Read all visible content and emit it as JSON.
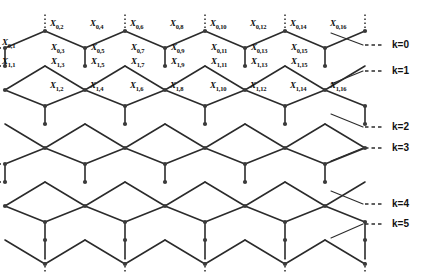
{
  "figure": {
    "type": "hexagonal-lattice-diagram",
    "width": 429,
    "height": 279,
    "background_color": "#ffffff",
    "line_color": "#2b2b2b",
    "node_color": "#3a3a3a",
    "label_color": "#111111"
  },
  "vertex_labels": [
    {
      "id": "x-0-1",
      "text": "X",
      "sub": "0,1",
      "x": 2,
      "y": 38
    },
    {
      "id": "x-1-1",
      "text": "X",
      "sub": "1,1",
      "x": 2,
      "y": 57
    },
    {
      "id": "x-0-2",
      "text": "X",
      "sub": "0,2",
      "x": 50,
      "y": 19
    },
    {
      "id": "x-0-4",
      "text": "X",
      "sub": "0,4",
      "x": 90,
      "y": 19
    },
    {
      "id": "x-0-6",
      "text": "X",
      "sub": "0,6",
      "x": 130,
      "y": 19
    },
    {
      "id": "x-0-8",
      "text": "X",
      "sub": "0,8",
      "x": 170,
      "y": 19
    },
    {
      "id": "x-0-10",
      "text": "X",
      "sub": "0,10",
      "x": 210,
      "y": 19
    },
    {
      "id": "x-0-12",
      "text": "X",
      "sub": "0,12",
      "x": 250,
      "y": 19
    },
    {
      "id": "x-0-14",
      "text": "X",
      "sub": "0,14",
      "x": 290,
      "y": 19
    },
    {
      "id": "x-0-16",
      "text": "X",
      "sub": "0,16",
      "x": 330,
      "y": 19
    },
    {
      "id": "x-0-3",
      "text": "X",
      "sub": "0,3",
      "x": 51,
      "y": 43
    },
    {
      "id": "x-0-5",
      "text": "X",
      "sub": "0,5",
      "x": 91,
      "y": 43
    },
    {
      "id": "x-0-7",
      "text": "X",
      "sub": "0,7",
      "x": 131,
      "y": 43
    },
    {
      "id": "x-0-9",
      "text": "X",
      "sub": "0,9",
      "x": 171,
      "y": 43
    },
    {
      "id": "x-0-11",
      "text": "X",
      "sub": "0,11",
      "x": 211,
      "y": 43
    },
    {
      "id": "x-0-13",
      "text": "X",
      "sub": "0,13",
      "x": 251,
      "y": 43
    },
    {
      "id": "x-0-15",
      "text": "X",
      "sub": "0,15",
      "x": 291,
      "y": 43
    },
    {
      "id": "x-1-3",
      "text": "X",
      "sub": "1,3",
      "x": 51,
      "y": 57
    },
    {
      "id": "x-1-5",
      "text": "X",
      "sub": "1,5",
      "x": 91,
      "y": 57
    },
    {
      "id": "x-1-7",
      "text": "X",
      "sub": "1,7",
      "x": 131,
      "y": 57
    },
    {
      "id": "x-1-9",
      "text": "X",
      "sub": "1,9",
      "x": 171,
      "y": 57
    },
    {
      "id": "x-1-11",
      "text": "X",
      "sub": "1,11",
      "x": 211,
      "y": 57
    },
    {
      "id": "x-1-13",
      "text": "X",
      "sub": "1,13",
      "x": 251,
      "y": 57
    },
    {
      "id": "x-1-15",
      "text": "X",
      "sub": "1,15",
      "x": 291,
      "y": 57
    },
    {
      "id": "x-1-2",
      "text": "X",
      "sub": "1,2",
      "x": 50,
      "y": 81
    },
    {
      "id": "x-1-4",
      "text": "X",
      "sub": "1,4",
      "x": 90,
      "y": 81
    },
    {
      "id": "x-1-6",
      "text": "X",
      "sub": "1,6",
      "x": 130,
      "y": 81
    },
    {
      "id": "x-1-8",
      "text": "X",
      "sub": "1,8",
      "x": 170,
      "y": 81
    },
    {
      "id": "x-1-10",
      "text": "X",
      "sub": "1,10",
      "x": 210,
      "y": 81
    },
    {
      "id": "x-1-12",
      "text": "X",
      "sub": "1,12",
      "x": 250,
      "y": 81
    },
    {
      "id": "x-1-14",
      "text": "X",
      "sub": "1,14",
      "x": 290,
      "y": 81
    },
    {
      "id": "x-1-16",
      "text": "X",
      "sub": "1,16",
      "x": 330,
      "y": 81
    }
  ],
  "k_labels": [
    {
      "id": "k-0",
      "text": "k=0",
      "x": 392,
      "y": 40
    },
    {
      "id": "k-1",
      "text": "k=1",
      "x": 392,
      "y": 66
    },
    {
      "id": "k-2",
      "text": "k=2",
      "x": 392,
      "y": 122
    },
    {
      "id": "k-3",
      "text": "k=3",
      "x": 392,
      "y": 143
    },
    {
      "id": "k-4",
      "text": "k=4",
      "x": 392,
      "y": 199
    },
    {
      "id": "k-5",
      "text": "k=5",
      "x": 392,
      "y": 219
    }
  ],
  "geometry": {
    "columns_x": [
      5,
      45,
      85,
      125,
      165,
      205,
      245,
      285,
      325,
      365
    ],
    "apex_rows_y": [
      31,
      90,
      148,
      206,
      264
    ],
    "waist_rows_y": [
      [
        48,
        66
      ],
      [
        106,
        124
      ],
      [
        164,
        182
      ],
      [
        222,
        240
      ]
    ],
    "node_radius": 2.1,
    "stroke_width": 1.6,
    "dash_pattern": "4,3"
  }
}
